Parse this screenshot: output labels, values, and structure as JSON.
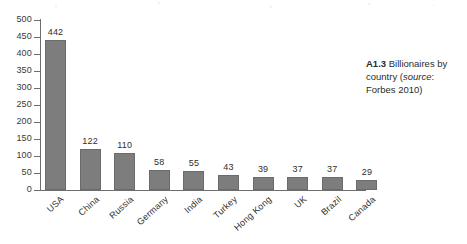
{
  "chart_data": {
    "type": "bar",
    "title": "",
    "xlabel": "",
    "ylabel": "",
    "ylim": [
      0,
      500
    ],
    "ytick_step": 50,
    "yticks": [
      500,
      450,
      400,
      350,
      300,
      250,
      200,
      150,
      100,
      50,
      0
    ],
    "grid": false,
    "legend": "none",
    "bar_color": "#7d7d7d",
    "categories": [
      "USA",
      "China",
      "Russia",
      "Germany",
      "India",
      "Turkey",
      "Hong Kong",
      "UK",
      "Brazil",
      "Canada"
    ],
    "values": [
      442,
      122,
      110,
      58,
      55,
      43,
      39,
      37,
      37,
      29
    ],
    "data_labels": [
      "442",
      "122",
      "110",
      "58",
      "55",
      "43",
      "39",
      "37",
      "37",
      "29"
    ]
  },
  "caption": {
    "number": "A1.3",
    "text_before_source": "Billionaires by country (",
    "source_word": "source",
    "text_after_source": ": Forbes 2010)"
  }
}
